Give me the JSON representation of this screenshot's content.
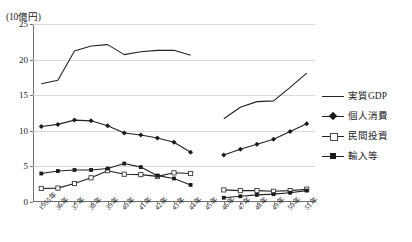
{
  "chart_data": {
    "type": "line",
    "title": "",
    "unit_label": "(10億円)",
    "xlabel": "",
    "ylabel": "",
    "ylim": [
      0,
      25
    ],
    "yticks": [
      0,
      5,
      10,
      15,
      20,
      25
    ],
    "grid": true,
    "legend_position": "right",
    "categories": [
      "1955年",
      "36年",
      "37年",
      "38年",
      "39年",
      "40年",
      "41年",
      "42年",
      "43年",
      "44年",
      "45年",
      "46年",
      "47年",
      "48年",
      "49年",
      "50年",
      "51年"
    ],
    "note": "Series have a data gap: values are absent for 45年 (index 10).",
    "series": [
      {
        "name": "実質GDP",
        "marker": "none",
        "values": [
          16.6,
          17.1,
          21.2,
          21.9,
          22.1,
          20.7,
          21.1,
          21.3,
          21.3,
          20.6,
          null,
          11.7,
          13.3,
          14.1,
          14.2,
          16.1,
          18.1
        ]
      },
      {
        "name": "個人消費",
        "marker": "filled-diamond",
        "values": [
          10.6,
          10.9,
          11.5,
          11.4,
          10.7,
          9.7,
          9.4,
          9.0,
          8.4,
          7.0,
          null,
          6.6,
          7.4,
          8.1,
          8.8,
          9.9,
          11.0
        ]
      },
      {
        "name": "民間投資",
        "marker": "open-square",
        "values": [
          1.9,
          1.95,
          2.6,
          3.4,
          4.4,
          3.9,
          3.85,
          3.6,
          4.1,
          4.0,
          null,
          1.7,
          1.6,
          1.6,
          1.5,
          1.6,
          1.8
        ]
      },
      {
        "name": "輸入等",
        "marker": "filled-square",
        "values": [
          4.0,
          4.35,
          4.5,
          4.5,
          4.7,
          5.4,
          4.9,
          3.7,
          3.3,
          2.4,
          null,
          0.6,
          0.8,
          1.0,
          1.1,
          1.3,
          1.6
        ]
      }
    ]
  },
  "legend": {
    "items": [
      {
        "label": "実質GDP"
      },
      {
        "label": "個人消費"
      },
      {
        "label": "民間投資"
      },
      {
        "label": "輸入等"
      }
    ]
  },
  "colors": {
    "line": "#222222",
    "grid": "#d8d8d8",
    "axis": "#6e6e6e",
    "background": "#ffffff"
  }
}
